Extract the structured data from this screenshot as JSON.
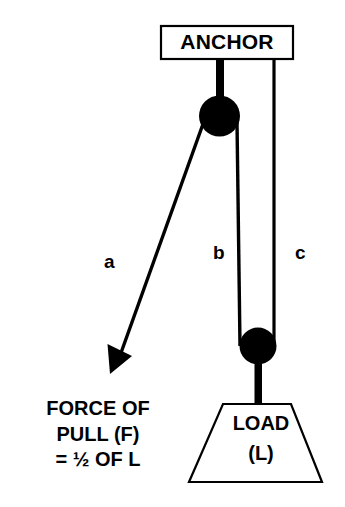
{
  "diagram": {
    "title_text": "ANCHOR",
    "anchor": {
      "label": "ANCHOR"
    },
    "load": {
      "label_line1": "LOAD",
      "label_line2": "(L)"
    },
    "ropes": [
      {
        "id": "a",
        "label": "a"
      },
      {
        "id": "b",
        "label": "b"
      },
      {
        "id": "c",
        "label": "c"
      }
    ],
    "force_caption": {
      "line1": "FORCE OF",
      "line2": "PULL (F)",
      "line3": "= ½ OF L"
    },
    "colors": {
      "stroke": "#000000",
      "fill": "#000000",
      "background": "#ffffff",
      "box_fill": "#ffffff"
    },
    "parts": {
      "upper_pulley": "upper-pulley-wheel",
      "lower_pulley": "lower-pulley-wheel",
      "anchor_bar": "anchor-support-bar",
      "load_hanger": "load-hanger-rod",
      "arrow": "force-arrow"
    }
  }
}
